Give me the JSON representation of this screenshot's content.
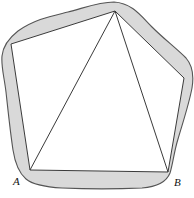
{
  "figure": {
    "labels": [
      {
        "id": "A",
        "text": "A",
        "x": 30,
        "y": 170
      },
      {
        "id": "B",
        "text": "B",
        "x": 168,
        "y": 172
      }
    ],
    "colors": {
      "background": "#ffffff",
      "shaded_region": "#d9d9d9",
      "curve_stroke": "#555555",
      "polygon_stroke": "#3a3a3a",
      "polygon_fill": "#ffffff",
      "label_color": "#111111"
    },
    "geometry": {
      "outer_curve_path": "M 114 2 C 132 3 141 16 152 27 C 164 39 176 48 186 58 C 193 66 194 76 192 88 C 189 104 183 122 178 139 C 174 152 173 163 170 173 C 166 183 155 187 142 188 C 118 189 86 189 62 188 C 45 187 33 185 26 179 C 19 173 15 163 13 150 C 10 130 8 110 6 92 C 4 76 1 66 2 56 C 3 46 9 38 18 31 C 35 19 52 16 68 12 C 84 8 99 2 114 2 Z",
      "polygon_points": "115,11 11,44 30,170 168,172 184,78",
      "diagonals": [
        {
          "from": [
            30,
            170
          ],
          "to": [
            115,
            11
          ]
        },
        {
          "from": [
            168,
            172
          ],
          "to": [
            115,
            11
          ]
        }
      ]
    }
  }
}
